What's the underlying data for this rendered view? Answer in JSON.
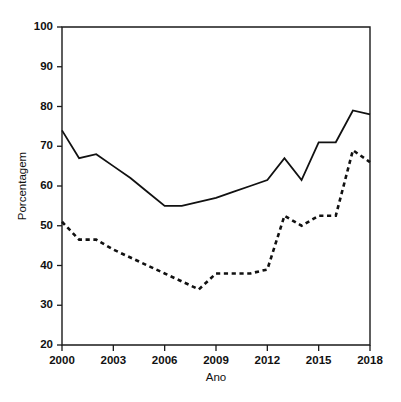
{
  "chart_data": {
    "type": "line",
    "title": "",
    "xlabel": "Ano",
    "ylabel": "Porcentagem",
    "xlim": [
      2000,
      2018
    ],
    "ylim": [
      20,
      100
    ],
    "xticks": [
      2000,
      2003,
      2006,
      2009,
      2012,
      2015,
      2018
    ],
    "yticks": [
      20,
      30,
      40,
      50,
      60,
      70,
      80,
      90,
      100
    ],
    "grid": false,
    "legend": "none",
    "x": [
      2000,
      2001,
      2002,
      2003,
      2004,
      2005,
      2006,
      2007,
      2008,
      2009,
      2010,
      2011,
      2012,
      2013,
      2014,
      2015,
      2016,
      2017,
      2018
    ],
    "series": [
      {
        "name": "solid-series",
        "style": "solid",
        "color": "#111111",
        "values": [
          74,
          67,
          68,
          65,
          62,
          58.5,
          55,
          55,
          56,
          57,
          58.5,
          60,
          61.5,
          67,
          61.5,
          71,
          71,
          79,
          78
        ]
      },
      {
        "name": "dashed-series",
        "style": "dashed",
        "color": "#111111",
        "values": [
          51,
          46.5,
          46.5,
          44,
          42,
          40,
          38,
          36,
          34,
          38,
          38,
          38,
          39,
          52.5,
          50,
          52.5,
          52.5,
          69,
          66
        ]
      }
    ]
  },
  "axes": {
    "y_title": "Porcentagem",
    "x_title": "Ano",
    "y_tick_labels": [
      "100",
      "90",
      "80",
      "70",
      "60",
      "50",
      "40",
      "30",
      "20"
    ],
    "x_tick_labels": [
      "2000",
      "2003",
      "2006",
      "2009",
      "2012",
      "2015",
      "2018"
    ]
  }
}
